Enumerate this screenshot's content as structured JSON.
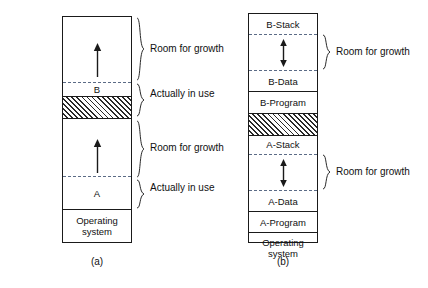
{
  "figure": {
    "panels": [
      {
        "caption": "(a)",
        "segments": [
          {
            "label": "",
            "name": "b-growth-space"
          },
          {
            "label": "B",
            "name": "process-b"
          },
          {
            "label": "",
            "name": "hole-hatched"
          },
          {
            "label": "",
            "name": "a-growth-space"
          },
          {
            "label": "A",
            "name": "process-a"
          },
          {
            "label": "Operating\nsystem",
            "name": "operating-system"
          }
        ],
        "braces": [
          {
            "label": "Room for growth",
            "name": "brace-b-room-for-growth"
          },
          {
            "label": "Actually in use",
            "name": "brace-b-actually-in-use"
          },
          {
            "label": "Room for growth",
            "name": "brace-a-room-for-growth"
          },
          {
            "label": "Actually in use",
            "name": "brace-a-actually-in-use"
          }
        ]
      },
      {
        "caption": "(b)",
        "segments": [
          {
            "label": "B-Stack",
            "name": "b-stack"
          },
          {
            "label": "",
            "name": "b-growth-space"
          },
          {
            "label": "B-Data",
            "name": "b-data"
          },
          {
            "label": "B-Program",
            "name": "b-program"
          },
          {
            "label": "",
            "name": "hole-hatched"
          },
          {
            "label": "A-Stack",
            "name": "a-stack"
          },
          {
            "label": "",
            "name": "a-growth-space"
          },
          {
            "label": "A-Data",
            "name": "a-data"
          },
          {
            "label": "A-Program",
            "name": "a-program"
          },
          {
            "label": "Operating\nsystem",
            "name": "operating-system"
          }
        ],
        "braces": [
          {
            "label": "Room for growth",
            "name": "brace-b-room-for-growth"
          },
          {
            "label": "Room for growth",
            "name": "brace-a-room-for-growth"
          }
        ]
      }
    ]
  },
  "colors": {
    "stroke": "#1a1a1a",
    "dashed": "#5b6b86",
    "background": "#ffffff",
    "text": "#111111"
  }
}
